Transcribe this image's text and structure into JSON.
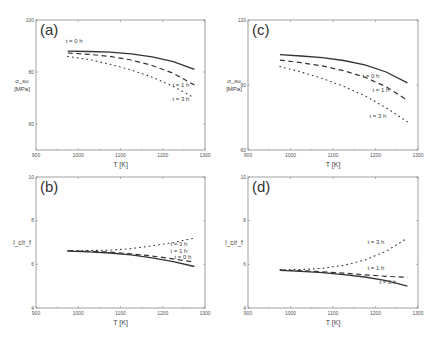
{
  "chart_data": [
    {
      "type": "line",
      "panel": "(a)",
      "xlabel": "T [K]",
      "ylabel_symbol": "σ_su",
      "ylabel_unit": "[MPa]",
      "xlim": [
        900,
        1300
      ],
      "ylim": [
        50,
        100
      ],
      "xticks": [
        900,
        1000,
        1100,
        1200,
        1300
      ],
      "yticks": [
        60,
        80,
        100
      ],
      "grid": false,
      "series": [
        {
          "name": "t = 0 h",
          "style": "solid",
          "x": [
            975,
            1025,
            1075,
            1125,
            1175,
            1225,
            1275
          ],
          "y": [
            88.0,
            87.9,
            87.6,
            87.0,
            85.8,
            84.0,
            81.0
          ]
        },
        {
          "name": "t = 1 h",
          "style": "dashed",
          "x": [
            975,
            1025,
            1075,
            1125,
            1175,
            1225,
            1275
          ],
          "y": [
            87.3,
            86.8,
            86.0,
            84.6,
            82.5,
            79.5,
            75.0
          ]
        },
        {
          "name": "t = 3 h",
          "style": "dotted",
          "x": [
            975,
            1025,
            1075,
            1125,
            1175,
            1225,
            1275
          ],
          "y": [
            86.0,
            84.8,
            83.0,
            80.8,
            78.0,
            74.5,
            70.0
          ]
        }
      ]
    },
    {
      "type": "line",
      "panel": "(c)",
      "xlabel": "T [K]",
      "ylabel_symbol": "σ_su",
      "ylabel_unit": "[MPa]",
      "xlim": [
        900,
        1300
      ],
      "ylim": [
        60,
        120
      ],
      "xticks": [
        900,
        1000,
        1100,
        1200,
        1300
      ],
      "yticks": [
        60,
        90,
        120
      ],
      "grid": false,
      "series": [
        {
          "name": "t = 0 h",
          "style": "solid",
          "x": [
            975,
            1025,
            1075,
            1125,
            1175,
            1225,
            1275
          ],
          "y": [
            104.0,
            103.4,
            102.6,
            101.3,
            99.3,
            96.0,
            91.0
          ]
        },
        {
          "name": "t = 1 h",
          "style": "dashed",
          "x": [
            975,
            1025,
            1075,
            1125,
            1175,
            1225,
            1275
          ],
          "y": [
            101.5,
            100.3,
            98.8,
            96.6,
            93.6,
            89.2,
            83.0
          ]
        },
        {
          "name": "t = 3 h",
          "style": "dotted",
          "x": [
            975,
            1025,
            1075,
            1125,
            1175,
            1225,
            1275
          ],
          "y": [
            98.5,
            96.0,
            93.0,
            89.4,
            85.0,
            79.5,
            73.0
          ]
        }
      ]
    },
    {
      "type": "line",
      "panel": "(b)",
      "xlabel": "T [K]",
      "ylabel_symbol": "l_c/r_f",
      "xlim": [
        900,
        1300
      ],
      "ylim": [
        4,
        10
      ],
      "xticks": [
        900,
        1000,
        1100,
        1200,
        1300
      ],
      "yticks": [
        4,
        6,
        8,
        10
      ],
      "grid": false,
      "series": [
        {
          "name": "t = 0 h",
          "style": "solid",
          "x": [
            975,
            1025,
            1075,
            1125,
            1175,
            1225,
            1275
          ],
          "y": [
            6.6,
            6.57,
            6.52,
            6.43,
            6.3,
            6.12,
            5.9
          ]
        },
        {
          "name": "t = 1 h",
          "style": "dashed",
          "x": [
            975,
            1025,
            1075,
            1125,
            1175,
            1225,
            1275
          ],
          "y": [
            6.62,
            6.6,
            6.56,
            6.48,
            6.38,
            6.25,
            6.1
          ]
        },
        {
          "name": "t = 3 h",
          "style": "dotted",
          "x": [
            975,
            1025,
            1075,
            1125,
            1175,
            1225,
            1275
          ],
          "y": [
            6.62,
            6.63,
            6.65,
            6.72,
            6.85,
            7.0,
            7.2
          ]
        }
      ]
    },
    {
      "type": "line",
      "panel": "(d)",
      "xlabel": "T [K]",
      "ylabel_symbol": "l_c/r_f",
      "xlim": [
        900,
        1300
      ],
      "ylim": [
        4,
        10
      ],
      "xticks": [
        900,
        1000,
        1100,
        1200,
        1300
      ],
      "yticks": [
        4,
        6,
        8,
        10
      ],
      "grid": false,
      "series": [
        {
          "name": "t = 0 h",
          "style": "solid",
          "x": [
            975,
            1025,
            1075,
            1125,
            1175,
            1225,
            1275
          ],
          "y": [
            5.72,
            5.68,
            5.62,
            5.53,
            5.42,
            5.25,
            5.0
          ]
        },
        {
          "name": "t = 1 h",
          "style": "dashed",
          "x": [
            975,
            1025,
            1075,
            1125,
            1175,
            1225,
            1275
          ],
          "y": [
            5.74,
            5.71,
            5.66,
            5.6,
            5.52,
            5.45,
            5.4
          ]
        },
        {
          "name": "t = 3 h",
          "style": "dotted",
          "x": [
            975,
            1025,
            1075,
            1125,
            1175,
            1225,
            1275
          ],
          "y": [
            5.75,
            5.76,
            5.82,
            5.95,
            6.2,
            6.6,
            7.2
          ]
        }
      ]
    }
  ]
}
